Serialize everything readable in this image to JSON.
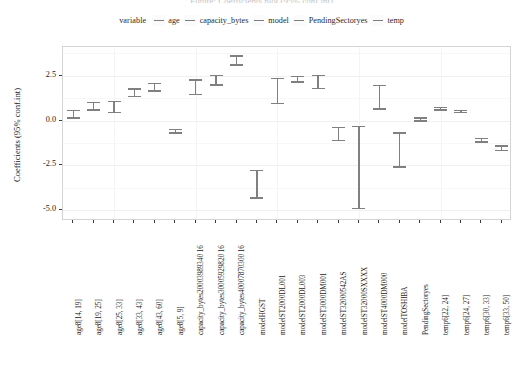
{
  "cut_title": "Figure: Coefficients plot (95% conf.int)",
  "legend": {
    "title": "variable",
    "items": [
      {
        "label": "age",
        "color": "#7e7e7e",
        "key_icon": "line-key-icon"
      },
      {
        "label": "capacity_bytes",
        "color": "#7e7e7e",
        "key_icon": "line-key-icon"
      },
      {
        "label": "model",
        "color": "#7e7e7e",
        "key_icon": "line-key-icon"
      },
      {
        "label": "PendingSectoryes",
        "color": "#7e7e7e",
        "key_icon": "line-key-icon"
      },
      {
        "label": "temp",
        "color": "#7e7e7e",
        "key_icon": "line-key-icon"
      }
    ]
  },
  "chart_data": {
    "type": "scatter",
    "title": "",
    "xlabel": "",
    "ylabel": "Coefficients (95% conf.int)",
    "ylim": [
      -5.6,
      4.1
    ],
    "yticks": [
      2.5,
      0.0,
      -2.5,
      -5.0
    ],
    "ytick_labels": [
      "2.5",
      "0.0",
      "-2.5",
      "-5.0"
    ],
    "grid": true,
    "legend_position": "top",
    "error_bar_style": "95% confidence interval",
    "categories": [
      "age8[14, 19]",
      "age8[19, 25]",
      "age8[25, 33]",
      "age8[33, 43]",
      "age8[43, 60]",
      "age8[5, 9]",
      "capacity_bytes20003989340 16",
      "capacity_bytes30005929820 16",
      "capacity_bytes40007870300 16",
      "modelHGST",
      "modelST2000DL001",
      "modelST2000DL003",
      "modelST3000DM001",
      "modelST32000542AS",
      "modelST32000SXXXX",
      "modelST4000DM000",
      "modelTOSHIBA",
      "PendingSectoryes",
      "temp6[22, 24]",
      "temp6[24, 27]",
      "temp6[30, 33]",
      "temp6[33, 50]"
    ],
    "series": [
      {
        "name": "coefficient",
        "points": [
          {
            "category": "age8[14, 19]",
            "group": "age",
            "estimate": 0.35,
            "low": 0.1,
            "high": 0.6
          },
          {
            "category": "age8[19, 25]",
            "group": "age",
            "estimate": 0.8,
            "low": 0.55,
            "high": 1.05
          },
          {
            "category": "age8[25, 33]",
            "group": "age",
            "estimate": 0.75,
            "low": 0.4,
            "high": 1.1
          },
          {
            "category": "age8[33, 43]",
            "group": "age",
            "estimate": 1.55,
            "low": 1.3,
            "high": 1.8
          },
          {
            "category": "age8[43, 60]",
            "group": "age",
            "estimate": 1.85,
            "low": 1.6,
            "high": 2.1
          },
          {
            "category": "age8[5, 9]",
            "group": "age",
            "estimate": -0.6,
            "low": -0.75,
            "high": -0.45
          },
          {
            "category": "capacity_bytes20003989340 16",
            "group": "capacity_bytes",
            "estimate": 1.85,
            "low": 1.4,
            "high": 2.3
          },
          {
            "category": "capacity_bytes30005929820 16",
            "group": "capacity_bytes",
            "estimate": 2.25,
            "low": 1.95,
            "high": 2.55
          },
          {
            "category": "capacity_bytes40007870300 16",
            "group": "capacity_bytes",
            "estimate": 3.35,
            "low": 3.05,
            "high": 3.65
          },
          {
            "category": "modelHGST",
            "group": "model",
            "estimate": -3.55,
            "low": -4.35,
            "high": -2.75
          },
          {
            "category": "modelST2000DL001",
            "group": "model",
            "estimate": 1.65,
            "low": 0.9,
            "high": 2.4
          },
          {
            "category": "modelST2000DL003",
            "group": "model",
            "estimate": 2.3,
            "low": 2.1,
            "high": 2.5
          },
          {
            "category": "modelST3000DM001",
            "group": "model",
            "estimate": 2.15,
            "low": 1.75,
            "high": 2.55
          },
          {
            "category": "modelST32000542AS",
            "group": "model",
            "estimate": -0.75,
            "low": -1.15,
            "high": -0.35
          },
          {
            "category": "modelST32000SXXXX",
            "group": "model",
            "estimate": -2.6,
            "low": -4.95,
            "high": -0.3
          },
          {
            "category": "modelST4000DM000",
            "group": "model",
            "estimate": 1.3,
            "low": 0.6,
            "high": 2.0
          },
          {
            "category": "modelTOSHIBA",
            "group": "model",
            "estimate": -1.65,
            "low": -2.65,
            "high": -0.65
          },
          {
            "category": "PendingSectoryes",
            "group": "PendingSectoryes",
            "estimate": 0.05,
            "low": -0.08,
            "high": 0.18
          },
          {
            "category": "temp6[22, 24]",
            "group": "temp",
            "estimate": 0.65,
            "low": 0.55,
            "high": 0.78
          },
          {
            "category": "temp6[24, 27]",
            "group": "temp",
            "estimate": 0.5,
            "low": 0.4,
            "high": 0.6
          },
          {
            "category": "temp6[30, 33]",
            "group": "temp",
            "estimate": -1.1,
            "low": -1.25,
            "high": -0.95
          },
          {
            "category": "temp6[33, 50]",
            "group": "temp",
            "estimate": -1.55,
            "low": -1.72,
            "high": -1.38
          }
        ]
      }
    ]
  }
}
